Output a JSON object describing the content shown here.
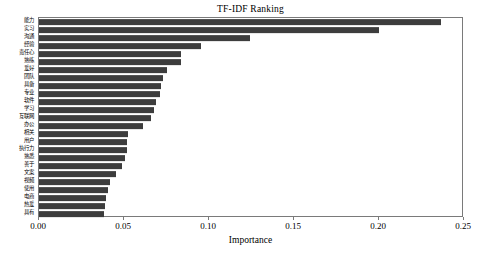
{
  "chart_data": {
    "type": "bar",
    "orientation": "horizontal",
    "title": "TF-IDF Ranking",
    "xlabel": "Importance",
    "ylabel": "",
    "xlim": [
      0.0,
      0.25
    ],
    "ylim": null,
    "grid": false,
    "legend": null,
    "bar_color": "#3d3d3d",
    "xticks": [
      "0.00",
      "0.05",
      "0.10",
      "0.15",
      "0.20",
      "0.25"
    ],
    "xtick_values": [
      0.0,
      0.05,
      0.1,
      0.15,
      0.2,
      0.25
    ],
    "categories": [
      "能力",
      "实习",
      "沟通",
      "经验",
      "责任心",
      "熟练",
      "爱好",
      "团队",
      "具备",
      "专业",
      "软件",
      "学习",
      "互联网",
      "办公",
      "相关",
      "用户",
      "执行力",
      "熟悉",
      "善于",
      "文案",
      "视频",
      "使用",
      "电商",
      "热爱",
      "具有"
    ],
    "values": [
      0.2365,
      0.2,
      0.124,
      0.095,
      0.0835,
      0.0835,
      0.0755,
      0.073,
      0.072,
      0.071,
      0.069,
      0.0675,
      0.066,
      0.061,
      0.0525,
      0.052,
      0.0515,
      0.0505,
      0.049,
      0.0455,
      0.042,
      0.0405,
      0.0395,
      0.039,
      0.0385
    ]
  }
}
